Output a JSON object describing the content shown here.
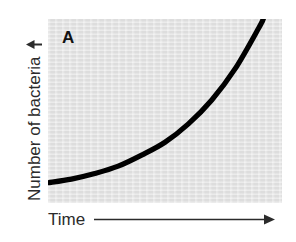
{
  "figure": {
    "panel_label": "A",
    "background_color": "#ffffff",
    "plot_background_color": "#e4e4e4",
    "curve_color": "#000000",
    "text_color": "#2b2b2b"
  },
  "axes": {
    "y": {
      "label": "Number of bacteria",
      "arrow_icon": "up-arrow-icon",
      "arrow_glyph": "↑"
    },
    "x": {
      "label": "Time",
      "arrow_icon": "right-arrow-icon",
      "arrow_glyph": "→"
    }
  },
  "chart_data": {
    "type": "line",
    "title": "A",
    "xlabel": "Time",
    "ylabel": "Number of bacteria",
    "grid": false,
    "legend": null,
    "axis_ticks": false,
    "xlim": [
      0,
      1
    ],
    "ylim": [
      0,
      1
    ],
    "series": [
      {
        "name": "Bacterial growth",
        "shape": "exponential",
        "x": [
          0.0,
          0.1,
          0.2,
          0.3,
          0.4,
          0.5,
          0.6,
          0.7,
          0.8,
          0.9,
          0.92
        ],
        "y": [
          0.11,
          0.13,
          0.16,
          0.2,
          0.26,
          0.33,
          0.43,
          0.56,
          0.73,
          0.95,
          1.0
        ]
      }
    ],
    "annotations": [
      {
        "text": "A",
        "x": 0.06,
        "y": 0.9
      }
    ]
  }
}
